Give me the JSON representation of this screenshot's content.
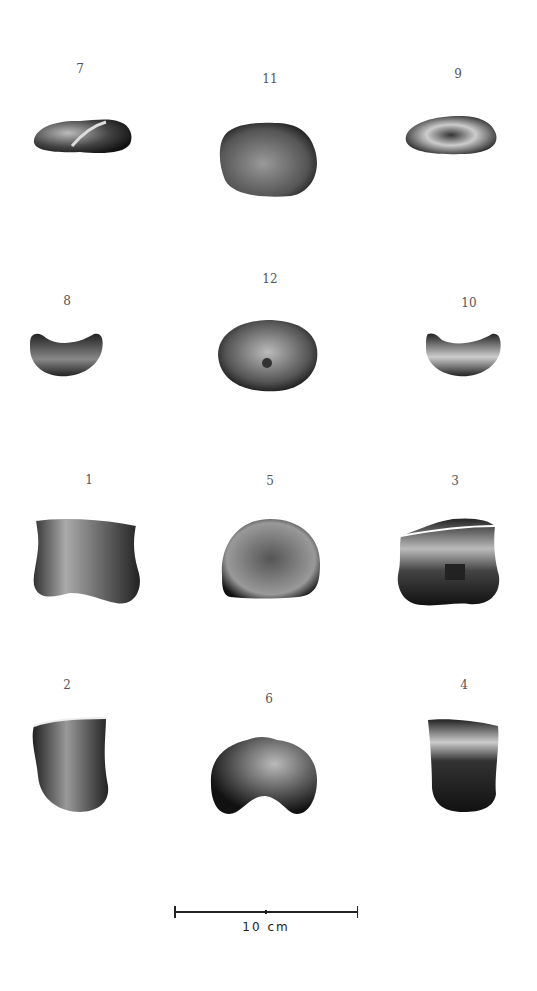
{
  "figures": [
    {
      "id": "7",
      "label": "7",
      "label_x": 80,
      "label_y": 62
    },
    {
      "id": "11",
      "label": "11",
      "label_x": 270,
      "label_y": 72
    },
    {
      "id": "9",
      "label": "9",
      "label_x": 458,
      "label_y": 67
    },
    {
      "id": "8",
      "label": "8",
      "label_x": 67,
      "label_y": 294
    },
    {
      "id": "12",
      "label": "12",
      "label_x": 270,
      "label_y": 272
    },
    {
      "id": "10",
      "label": "10",
      "label_x": 469,
      "label_y": 296
    },
    {
      "id": "1",
      "label": "1",
      "label_x": 89,
      "label_y": 473
    },
    {
      "id": "5",
      "label": "5",
      "label_x": 270,
      "label_y": 474
    },
    {
      "id": "3",
      "label": "3",
      "label_x": 455,
      "label_y": 474
    },
    {
      "id": "2",
      "label": "2",
      "label_x": 67,
      "label_y": 678
    },
    {
      "id": "6",
      "label": "6",
      "label_x": 269,
      "label_y": 692
    },
    {
      "id": "4",
      "label": "4",
      "label_x": 464,
      "label_y": 678
    }
  ],
  "scale_bar": {
    "label": "10 cm"
  }
}
